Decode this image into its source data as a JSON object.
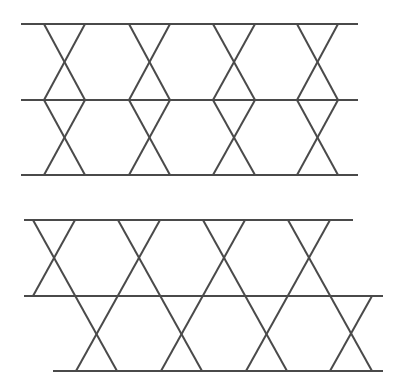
{
  "diagram": {
    "stroke_color": "#4a4a4a",
    "stroke_width": 2,
    "figures": [
      {
        "name": "aligned-x-pattern",
        "horizontal_lines": [
          {
            "x1": 21,
            "y": 24,
            "x2": 358
          },
          {
            "x1": 21,
            "y": 100,
            "x2": 358
          },
          {
            "x1": 21,
            "y": 175,
            "x2": 358
          }
        ],
        "diagonals": [
          [
            44,
            24,
            85,
            100
          ],
          [
            85,
            24,
            44,
            100
          ],
          [
            44,
            100,
            85,
            175
          ],
          [
            85,
            100,
            44,
            175
          ],
          [
            129,
            24,
            170,
            100
          ],
          [
            170,
            24,
            129,
            100
          ],
          [
            129,
            100,
            170,
            175
          ],
          [
            170,
            100,
            129,
            175
          ],
          [
            213,
            24,
            255,
            100
          ],
          [
            255,
            24,
            213,
            100
          ],
          [
            213,
            100,
            255,
            175
          ],
          [
            255,
            100,
            213,
            175
          ],
          [
            297,
            24,
            338,
            100
          ],
          [
            338,
            24,
            297,
            100
          ],
          [
            297,
            100,
            338,
            175
          ],
          [
            338,
            100,
            297,
            175
          ]
        ]
      },
      {
        "name": "offset-x-pattern",
        "horizontal_lines": [
          {
            "x1": 24,
            "y": 220,
            "x2": 353
          },
          {
            "x1": 24,
            "y": 296,
            "x2": 383
          },
          {
            "x1": 53,
            "y": 371,
            "x2": 383
          }
        ],
        "diagonals": [
          [
            33,
            220,
            117,
            371
          ],
          [
            75,
            220,
            33,
            296
          ],
          [
            118,
            220,
            202,
            371
          ],
          [
            160,
            220,
            76,
            371
          ],
          [
            203,
            220,
            287,
            371
          ],
          [
            245,
            220,
            161,
            371
          ],
          [
            288,
            220,
            372,
            371
          ],
          [
            330,
            220,
            246,
            371
          ],
          [
            372,
            296,
            330,
            371
          ]
        ]
      }
    ]
  }
}
